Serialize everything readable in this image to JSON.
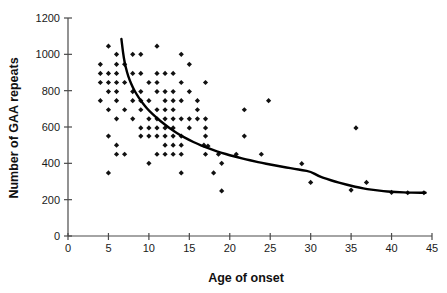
{
  "chart_data": {
    "type": "scatter",
    "title": "",
    "xlabel": "Age of onset",
    "ylabel": "Number of GAA repeats",
    "xlim": [
      0,
      45
    ],
    "ylim": [
      0,
      1200
    ],
    "xticks": [
      0,
      5,
      10,
      15,
      20,
      25,
      30,
      35,
      40,
      45
    ],
    "yticks": [
      0,
      200,
      400,
      600,
      800,
      1000,
      1200
    ],
    "xtick_labels": [
      "0",
      "5",
      "10",
      "15",
      "20",
      "25",
      "30",
      "35",
      "40",
      "45"
    ],
    "ytick_labels": [
      "0",
      "200",
      "400",
      "600",
      "800",
      "1000",
      "1200"
    ],
    "grid": false,
    "legend": null,
    "marker": "diamond",
    "marker_color": "#111111",
    "points": [
      [
        5.0,
        1045
      ],
      [
        11.0,
        1045
      ],
      [
        6.0,
        1000
      ],
      [
        8.0,
        1000
      ],
      [
        9.0,
        1000
      ],
      [
        14.0,
        1000
      ],
      [
        4.0,
        945
      ],
      [
        6.0,
        945
      ],
      [
        7.0,
        945
      ],
      [
        15.0,
        945
      ],
      [
        4.0,
        895
      ],
      [
        5.0,
        895
      ],
      [
        6.0,
        895
      ],
      [
        8.0,
        895
      ],
      [
        9.0,
        895
      ],
      [
        11.0,
        895
      ],
      [
        12.0,
        895
      ],
      [
        13.0,
        895
      ],
      [
        4.0,
        845
      ],
      [
        5.0,
        845
      ],
      [
        6.0,
        845
      ],
      [
        7.0,
        845
      ],
      [
        10.0,
        845
      ],
      [
        11.0,
        845
      ],
      [
        14.0,
        845
      ],
      [
        17.0,
        845
      ],
      [
        5.0,
        795
      ],
      [
        6.0,
        795
      ],
      [
        8.0,
        795
      ],
      [
        9.0,
        795
      ],
      [
        11.0,
        795
      ],
      [
        12.0,
        795
      ],
      [
        13.0,
        795
      ],
      [
        15.0,
        795
      ],
      [
        4.0,
        745
      ],
      [
        6.0,
        745
      ],
      [
        8.0,
        745
      ],
      [
        9.0,
        745
      ],
      [
        10.0,
        745
      ],
      [
        12.0,
        745
      ],
      [
        13.0,
        745
      ],
      [
        14.0,
        745
      ],
      [
        16.0,
        745
      ],
      [
        24.8,
        745
      ],
      [
        5.0,
        695
      ],
      [
        7.0,
        695
      ],
      [
        9.0,
        695
      ],
      [
        11.0,
        695
      ],
      [
        12.0,
        695
      ],
      [
        13.0,
        695
      ],
      [
        16.0,
        695
      ],
      [
        21.8,
        695
      ],
      [
        6.0,
        645
      ],
      [
        8.0,
        645
      ],
      [
        10.0,
        645
      ],
      [
        11.0,
        645
      ],
      [
        12.0,
        645
      ],
      [
        13.0,
        645
      ],
      [
        14.0,
        645
      ],
      [
        15.0,
        645
      ],
      [
        16.0,
        645
      ],
      [
        17.0,
        645
      ],
      [
        9.0,
        595
      ],
      [
        10.0,
        595
      ],
      [
        11.0,
        595
      ],
      [
        12.0,
        595
      ],
      [
        13.0,
        595
      ],
      [
        15.0,
        595
      ],
      [
        17.0,
        595
      ],
      [
        35.6,
        595
      ],
      [
        5.0,
        550
      ],
      [
        9.0,
        550
      ],
      [
        10.0,
        550
      ],
      [
        11.0,
        550
      ],
      [
        12.0,
        550
      ],
      [
        13.0,
        550
      ],
      [
        14.0,
        550
      ],
      [
        17.0,
        550
      ],
      [
        21.8,
        550
      ],
      [
        6.0,
        500
      ],
      [
        12.0,
        500
      ],
      [
        13.0,
        500
      ],
      [
        14.0,
        500
      ],
      [
        16.8,
        500
      ],
      [
        17.3,
        495
      ],
      [
        6.0,
        450
      ],
      [
        7.0,
        450
      ],
      [
        11.0,
        450
      ],
      [
        12.0,
        450
      ],
      [
        13.0,
        450
      ],
      [
        14.0,
        450
      ],
      [
        17.0,
        450
      ],
      [
        18.6,
        450
      ],
      [
        20.8,
        450
      ],
      [
        23.9,
        450
      ],
      [
        10.0,
        400
      ],
      [
        19.0,
        400
      ],
      [
        28.9,
        398
      ],
      [
        5.0,
        347
      ],
      [
        14.0,
        347
      ],
      [
        18.0,
        347
      ],
      [
        30.0,
        295
      ],
      [
        36.9,
        295
      ],
      [
        35.0,
        253
      ],
      [
        19.0,
        248
      ],
      [
        40.0,
        240
      ],
      [
        42.0,
        238
      ],
      [
        44.0,
        238
      ]
    ],
    "fit_curve": {
      "description": "decaying exponential fit line",
      "x_start": 6.6,
      "x_end": 44.2,
      "points": [
        [
          6.6,
          1085
        ],
        [
          6.8,
          1010
        ],
        [
          7.0,
          955
        ],
        [
          7.3,
          900
        ],
        [
          7.6,
          860
        ],
        [
          8.0,
          818
        ],
        [
          8.5,
          778
        ],
        [
          9.0,
          745
        ],
        [
          9.5,
          716
        ],
        [
          10.0,
          690
        ],
        [
          11.0,
          648
        ],
        [
          12.0,
          612
        ],
        [
          13.0,
          580
        ],
        [
          14.0,
          552
        ],
        [
          15.0,
          528
        ],
        [
          16.0,
          507
        ],
        [
          17.0,
          489
        ],
        [
          18.0,
          472
        ],
        [
          19.0,
          458
        ],
        [
          20.0,
          445
        ],
        [
          21.0,
          433
        ],
        [
          22.0,
          422
        ],
        [
          23.0,
          412
        ],
        [
          24.0,
          402
        ],
        [
          25.0,
          394
        ],
        [
          26.0,
          385
        ],
        [
          27.0,
          377
        ],
        [
          28.0,
          370
        ],
        [
          29.0,
          362
        ],
        [
          30.0,
          355
        ],
        [
          31.0,
          329
        ],
        [
          32.0,
          314
        ],
        [
          33.0,
          300
        ],
        [
          34.0,
          288
        ],
        [
          35.0,
          276
        ],
        [
          36.0,
          266
        ],
        [
          37.0,
          258
        ],
        [
          38.0,
          252
        ],
        [
          39.0,
          247
        ],
        [
          40.0,
          243
        ],
        [
          41.0,
          241
        ],
        [
          42.0,
          239
        ],
        [
          43.0,
          238
        ],
        [
          44.2,
          238
        ]
      ]
    }
  },
  "axes": {
    "x_title": "Age of onset",
    "y_title": "Number of GAA repeats"
  }
}
